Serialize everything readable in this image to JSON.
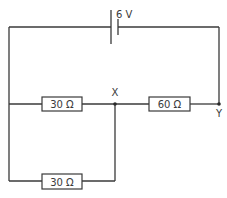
{
  "diagram": {
    "type": "circuit",
    "battery": {
      "label": "6 V"
    },
    "resistors": [
      {
        "id": "R1",
        "label": "30 Ω",
        "position": "middle-left"
      },
      {
        "id": "R2",
        "label": "60 Ω",
        "position": "middle-right"
      },
      {
        "id": "R3",
        "label": "30 Ω",
        "position": "bottom-left"
      }
    ],
    "nodes": [
      {
        "id": "X",
        "label": "X"
      },
      {
        "id": "Y",
        "label": "Y"
      }
    ],
    "colors": {
      "line": "#3a3a3a",
      "background": "#ffffff"
    }
  }
}
